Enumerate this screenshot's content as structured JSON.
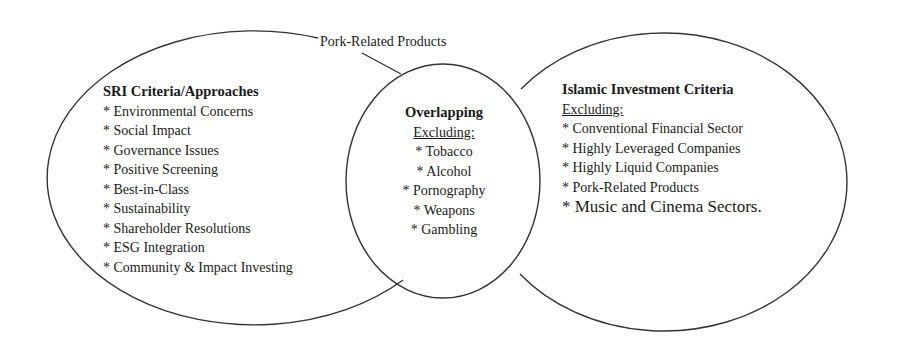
{
  "diagram": {
    "type": "venn",
    "callout_label": "Pork-Related Products",
    "left_set": {
      "title": "SRI Criteria/Approaches",
      "items": [
        "* Environmental Concerns",
        "* Social Impact",
        "* Governance Issues",
        "* Positive Screening",
        "* Best-in-Class",
        "* Sustainability",
        "* Shareholder Resolutions",
        "* ESG Integration",
        "* Community & Impact Investing"
      ]
    },
    "overlap": {
      "title": "Overlapping",
      "subtitle": "Excluding:",
      "items": [
        "* Tobacco",
        "* Alcohol",
        "* Pornography",
        "* Weapons",
        "* Gambling"
      ]
    },
    "right_set": {
      "title": "Islamic Investment Criteria",
      "subtitle": "Excluding:",
      "items": [
        "* Conventional Financial Sector",
        "* Highly Leveraged Companies",
        "* Highly Liquid Companies",
        "* Pork-Related Products",
        "* Music and Cinema Sectors."
      ]
    },
    "colors": {
      "stroke": "#333333",
      "text": "#1a1a1a",
      "background": "#ffffff"
    }
  }
}
